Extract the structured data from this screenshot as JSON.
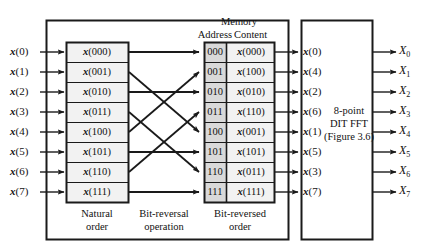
{
  "figure": {
    "title_headers": {
      "memory": "Memory",
      "address": "Address",
      "content": "Content"
    },
    "captions": {
      "natural_order_line1": "Natural",
      "natural_order_line2": "order",
      "bit_reversal_line1": "Bit-reversal",
      "bit_reversal_line2": "operation",
      "bit_reversed_line1": "Bit-reversed",
      "bit_reversed_line2": "order"
    },
    "fft_block": {
      "line1": "8-point",
      "line2": "DIT FFT",
      "line3": "(Figure 3.6)"
    },
    "colors": {
      "line": "#1a1a1a",
      "address_fill": "#d9d9d9",
      "content_fill": "#f2f2f2",
      "background": "#ffffff"
    }
  },
  "inputs": [
    {
      "name": "x",
      "index": "(0)"
    },
    {
      "name": "x",
      "index": "(1)"
    },
    {
      "name": "x",
      "index": "(2)"
    },
    {
      "name": "x",
      "index": "(3)"
    },
    {
      "name": "x",
      "index": "(4)"
    },
    {
      "name": "x",
      "index": "(5)"
    },
    {
      "name": "x",
      "index": "(6)"
    },
    {
      "name": "x",
      "index": "(7)"
    }
  ],
  "natural_order_cells": [
    {
      "name": "x",
      "index": "(000)"
    },
    {
      "name": "x",
      "index": "(001)"
    },
    {
      "name": "x",
      "index": "(010)"
    },
    {
      "name": "x",
      "index": "(011)"
    },
    {
      "name": "x",
      "index": "(100)"
    },
    {
      "name": "x",
      "index": "(101)"
    },
    {
      "name": "x",
      "index": "(110)"
    },
    {
      "name": "x",
      "index": "(111)"
    }
  ],
  "memory_rows": [
    {
      "address": "000",
      "content_name": "x",
      "content_index": "(000)"
    },
    {
      "address": "001",
      "content_name": "x",
      "content_index": "(100)"
    },
    {
      "address": "010",
      "content_name": "x",
      "content_index": "(010)"
    },
    {
      "address": "011",
      "content_name": "x",
      "content_index": "(110)"
    },
    {
      "address": "100",
      "content_name": "x",
      "content_index": "(001)"
    },
    {
      "address": "101",
      "content_name": "x",
      "content_index": "(101)"
    },
    {
      "address": "110",
      "content_name": "x",
      "content_index": "(011)"
    },
    {
      "address": "111",
      "content_name": "x",
      "content_index": "(111)"
    }
  ],
  "fft_inputs": [
    {
      "name": "x",
      "index": "(0)"
    },
    {
      "name": "x",
      "index": "(4)"
    },
    {
      "name": "x",
      "index": "(2)"
    },
    {
      "name": "x",
      "index": "(6)"
    },
    {
      "name": "x",
      "index": "(1)"
    },
    {
      "name": "x",
      "index": "(5)"
    },
    {
      "name": "x",
      "index": "(3)"
    },
    {
      "name": "x",
      "index": "(7)"
    }
  ],
  "outputs": [
    {
      "name": "X",
      "sub": "0"
    },
    {
      "name": "X",
      "sub": "1"
    },
    {
      "name": "X",
      "sub": "2"
    },
    {
      "name": "X",
      "sub": "3"
    },
    {
      "name": "X",
      "sub": "4"
    },
    {
      "name": "X",
      "sub": "5"
    },
    {
      "name": "X",
      "sub": "6"
    },
    {
      "name": "X",
      "sub": "7"
    }
  ],
  "bit_reversal_mapping": [
    {
      "from_row": 0,
      "to_row": 0
    },
    {
      "from_row": 1,
      "to_row": 4
    },
    {
      "from_row": 2,
      "to_row": 2
    },
    {
      "from_row": 3,
      "to_row": 6
    },
    {
      "from_row": 4,
      "to_row": 1
    },
    {
      "from_row": 5,
      "to_row": 5
    },
    {
      "from_row": 6,
      "to_row": 3
    },
    {
      "from_row": 7,
      "to_row": 7
    }
  ]
}
